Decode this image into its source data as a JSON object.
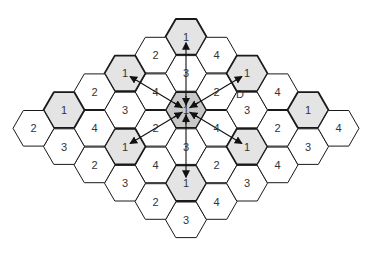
{
  "diagram": {
    "center": {
      "x": 186,
      "y": 110
    },
    "hex_radius": 20.5,
    "col_spacing": 30.5,
    "half_row": 18.3,
    "colors": {
      "stroke": "#1a1a1a",
      "shaded": "#e4e4e4",
      "center_shade": "#c8c8c8",
      "plain": "#ffffff",
      "arrow": "#111111"
    },
    "cells": [
      {
        "k": 0,
        "m": -4,
        "label": "1",
        "shaded": true
      },
      {
        "k": 0,
        "m": -2,
        "label": "3"
      },
      {
        "k": 0,
        "m": 0,
        "label": "1",
        "shaded": true,
        "center": true
      },
      {
        "k": 0,
        "m": 2,
        "label": "3"
      },
      {
        "k": 0,
        "m": 4,
        "label": "1",
        "shaded": true
      },
      {
        "k": 0,
        "m": 6,
        "label": "3"
      },
      {
        "k": -1,
        "m": -3,
        "label": "2"
      },
      {
        "k": -1,
        "m": -1,
        "label": "4"
      },
      {
        "k": -1,
        "m": 1,
        "label": "2"
      },
      {
        "k": -1,
        "m": 3,
        "label": "4"
      },
      {
        "k": -1,
        "m": 5,
        "label": "2"
      },
      {
        "k": 1,
        "m": -3,
        "label": "4"
      },
      {
        "k": 1,
        "m": -1,
        "label": "2"
      },
      {
        "k": 1,
        "m": 1,
        "label": "4"
      },
      {
        "k": 1,
        "m": 3,
        "label": "2"
      },
      {
        "k": 1,
        "m": 5,
        "label": "4"
      },
      {
        "k": -2,
        "m": -2,
        "label": "1",
        "shaded": true
      },
      {
        "k": -2,
        "m": 0,
        "label": "3"
      },
      {
        "k": -2,
        "m": 2,
        "label": "1",
        "shaded": true
      },
      {
        "k": -2,
        "m": 4,
        "label": "3"
      },
      {
        "k": 2,
        "m": -2,
        "label": "1",
        "shaded": true
      },
      {
        "k": 2,
        "m": 0,
        "label": "3"
      },
      {
        "k": 2,
        "m": 2,
        "label": "1",
        "shaded": true
      },
      {
        "k": 2,
        "m": 4,
        "label": "3"
      },
      {
        "k": -3,
        "m": -1,
        "label": "2"
      },
      {
        "k": -3,
        "m": 1,
        "label": "4"
      },
      {
        "k": -3,
        "m": 3,
        "label": "2"
      },
      {
        "k": 3,
        "m": -1,
        "label": "4"
      },
      {
        "k": 3,
        "m": 1,
        "label": "2"
      },
      {
        "k": 3,
        "m": 3,
        "label": "4"
      },
      {
        "k": -4,
        "m": 0,
        "label": "1",
        "shaded": true
      },
      {
        "k": -4,
        "m": 2,
        "label": "3"
      },
      {
        "k": 4,
        "m": 0,
        "label": "1",
        "shaded": true
      },
      {
        "k": 4,
        "m": 2,
        "label": "3"
      },
      {
        "k": -5,
        "m": 1,
        "label": "2"
      },
      {
        "k": 5,
        "m": 1,
        "label": "4"
      }
    ],
    "arrows": [
      {
        "to_k": 0,
        "to_m": -4,
        "via_label": "3"
      },
      {
        "to_k": 0,
        "to_m": 4,
        "via_label": "3"
      },
      {
        "to_k": -2,
        "to_m": -2,
        "via_label": "4"
      },
      {
        "to_k": 2,
        "to_m": 2,
        "via_label": "4"
      },
      {
        "to_k": -2,
        "to_m": 2,
        "via_label": "2"
      },
      {
        "to_k": 2,
        "to_m": -2,
        "via_label": "2"
      }
    ],
    "annotation": {
      "text": "D",
      "x": 236,
      "y": 98
    }
  }
}
